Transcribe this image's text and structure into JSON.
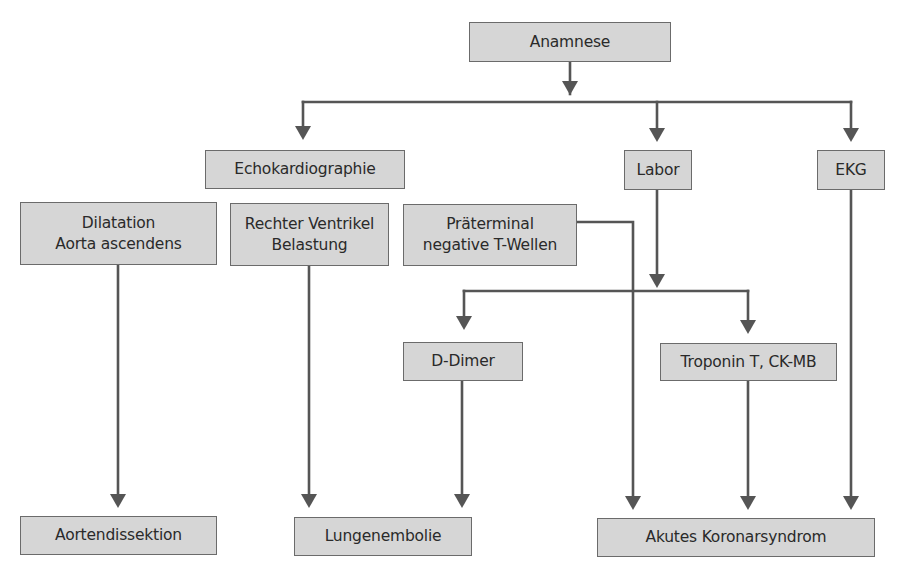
{
  "diagram": {
    "type": "flowchart",
    "colors": {
      "node_fill": "#d6d6d6",
      "node_border": "#6b6b6b",
      "edge": "#555555",
      "text": "#2a2a2a",
      "background": "#ffffff"
    },
    "nodes": {
      "anamnese": {
        "lines": [
          "Anamnese"
        ]
      },
      "echokardiographie": {
        "lines": [
          "Echokardiographie"
        ]
      },
      "labor": {
        "lines": [
          "Labor"
        ]
      },
      "ekg": {
        "lines": [
          "EKG"
        ]
      },
      "dilatation": {
        "lines": [
          "Dilatation",
          "Aorta ascendens"
        ]
      },
      "rechter_ventrikel": {
        "lines": [
          "Rechter Ventrikel",
          "Belastung"
        ]
      },
      "praeterminal": {
        "lines": [
          "Präterminal",
          "negative T-Wellen"
        ]
      },
      "d_dimer": {
        "lines": [
          "D-Dimer"
        ]
      },
      "troponin": {
        "lines": [
          "Troponin T, CK-MB"
        ]
      },
      "aortendissektion": {
        "lines": [
          "Aortendissektion"
        ]
      },
      "lungenembolie": {
        "lines": [
          "Lungenembolie"
        ]
      },
      "akutes_koronarsyndrom": {
        "lines": [
          "Akutes Koronarsyndrom"
        ]
      }
    },
    "edges": [
      {
        "from": "Anamnese",
        "to": "Echokardiographie"
      },
      {
        "from": "Anamnese",
        "to": "Labor"
      },
      {
        "from": "Anamnese",
        "to": "EKG"
      },
      {
        "from": "Labor",
        "to": "D-Dimer"
      },
      {
        "from": "Labor",
        "to": "Troponin T, CK-MB"
      },
      {
        "from": "Dilatation Aorta ascendens",
        "to": "Aortendissektion"
      },
      {
        "from": "Rechter Ventrikel Belastung",
        "to": "Lungenembolie"
      },
      {
        "from": "D-Dimer",
        "to": "Lungenembolie"
      },
      {
        "from": "Präterminal negative T-Wellen",
        "to": "Akutes Koronarsyndrom"
      },
      {
        "from": "Troponin T, CK-MB",
        "to": "Akutes Koronarsyndrom"
      },
      {
        "from": "EKG",
        "to": "Akutes Koronarsyndrom"
      }
    ]
  }
}
